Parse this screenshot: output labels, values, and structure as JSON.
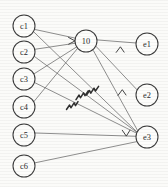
{
  "diagram": {
    "width": 168,
    "height": 187,
    "colors": {
      "background": "#fbfbf9",
      "node_stroke": "#3b3b3b",
      "node_fill": "#fdfdfb",
      "edge_stroke": "#6a6a6a",
      "arrow_stroke": "#3a3a3a",
      "squiggle_stroke": "#2e2e2e",
      "label_fill": "#2b2b2b"
    },
    "left_nodes": [
      {
        "id": "c1",
        "label": "c1",
        "cx": 24,
        "cy": 26,
        "r": 11
      },
      {
        "id": "c2",
        "label": "c2",
        "cx": 24,
        "cy": 52,
        "r": 11
      },
      {
        "id": "c3",
        "label": "c3",
        "cx": 24,
        "cy": 79,
        "r": 11
      },
      {
        "id": "c4",
        "label": "c4",
        "cx": 24,
        "cy": 107,
        "r": 11
      },
      {
        "id": "c5",
        "label": "c5",
        "cx": 24,
        "cy": 135,
        "r": 11
      },
      {
        "id": "c6",
        "label": "c6",
        "cx": 24,
        "cy": 166,
        "r": 11
      }
    ],
    "center_nodes": [
      {
        "id": "l0",
        "label": "10",
        "cx": 86,
        "cy": 41,
        "r": 11
      }
    ],
    "right_nodes": [
      {
        "id": "e1",
        "label": "e1",
        "cx": 147,
        "cy": 44,
        "r": 11
      },
      {
        "id": "e2",
        "label": "e2",
        "cx": 147,
        "cy": 95,
        "r": 11
      },
      {
        "id": "e3",
        "label": "e3",
        "cx": 147,
        "cy": 137,
        "r": 11
      }
    ],
    "edges": [
      {
        "from": "c1",
        "to": "l0"
      },
      {
        "from": "c1",
        "to": "e3"
      },
      {
        "from": "c2",
        "to": "l0"
      },
      {
        "from": "c2",
        "to": "e3"
      },
      {
        "from": "c3",
        "to": "l0"
      },
      {
        "from": "c3",
        "to": "e3"
      },
      {
        "from": "c4",
        "to": "l0"
      },
      {
        "from": "c5",
        "to": "e3"
      },
      {
        "from": "c6",
        "to": "e3"
      },
      {
        "from": "l0",
        "to": "e1"
      },
      {
        "from": "l0",
        "to": "e2"
      },
      {
        "from": "l0",
        "to": "e3"
      }
    ],
    "arrow_markers": [
      {
        "id": "arrow-into-l0",
        "glyph": ">",
        "x": 72,
        "y": 41
      },
      {
        "id": "arrow-to-e1",
        "glyph": "^",
        "x": 120,
        "y": 49
      },
      {
        "id": "arrow-to-e2",
        "glyph": "^",
        "x": 122,
        "y": 92
      },
      {
        "id": "arrow-to-e3",
        "glyph": "v",
        "x": 126,
        "y": 133
      }
    ],
    "squiggles": [
      {
        "id": "squiggle-1",
        "x": 93,
        "y": 90
      },
      {
        "id": "squiggle-2",
        "x": 83,
        "y": 94
      },
      {
        "id": "squiggle-3",
        "x": 73,
        "y": 104
      }
    ]
  }
}
